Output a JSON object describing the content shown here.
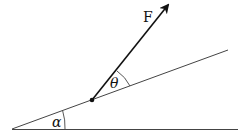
{
  "diagram": {
    "labels": {
      "force": "F",
      "angle_force": "θ",
      "angle_incline": "α"
    },
    "colors": {
      "line": "#333333",
      "arrow": "#111111",
      "background": "#ffffff"
    }
  }
}
